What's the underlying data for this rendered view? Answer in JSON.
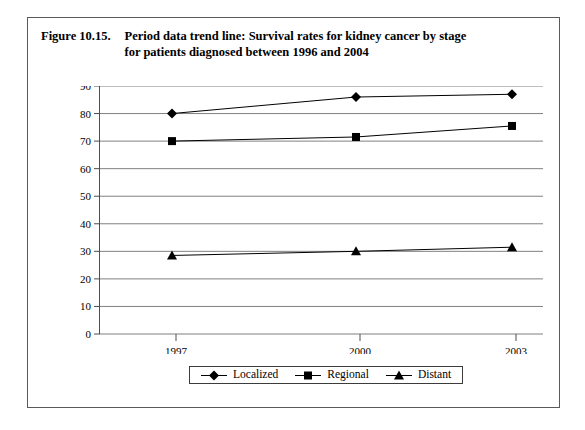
{
  "figure": {
    "number": "Figure 10.15.",
    "title_line1": "Period data trend line: Survival rates for kidney cancer by stage",
    "title_line2": "for patients diagnosed between 1996 and 2004"
  },
  "chart_data": {
    "type": "line",
    "title": "Period data trend line: Survival rates for kidney cancer by stage for patients diagnosed between 1996 and 2004",
    "xlabel": "",
    "ylabel": "",
    "categories": [
      "1997",
      "2000",
      "2003"
    ],
    "x": [
      1997,
      2000,
      2003
    ],
    "series": [
      {
        "name": "Localized",
        "marker": "diamond",
        "values": [
          80,
          86,
          87
        ]
      },
      {
        "name": "Regional",
        "marker": "square",
        "values": [
          70,
          71.5,
          75.5
        ]
      },
      {
        "name": "Distant",
        "marker": "triangle",
        "values": [
          28.5,
          30,
          31.5
        ]
      }
    ],
    "ylim": [
      0,
      90
    ],
    "yticks": [
      0,
      10,
      20,
      30,
      40,
      50,
      60,
      70,
      80,
      90
    ],
    "ytick_labels": [
      "0",
      "10",
      "20",
      "30",
      "40",
      "50",
      "60",
      "70",
      "80",
      "90"
    ],
    "xtick_labels": [
      "1997",
      "2000",
      "2003"
    ],
    "grid": "horizontal",
    "legend_position": "bottom-center",
    "legend_entries": [
      "Localized",
      "Regional",
      "Distant"
    ],
    "colors": {
      "line": "#000000",
      "marker": "#000000",
      "grid": "#808080",
      "axis": "#4d4d4d",
      "background": "#ffffff"
    }
  }
}
